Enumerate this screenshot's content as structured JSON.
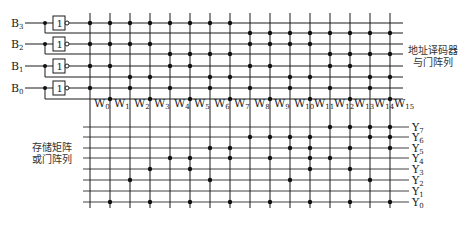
{
  "diagram": {
    "title_decoder": [
      "地址译码器",
      "与门阵列"
    ],
    "title_memory": [
      "存储矩阵",
      "或门阵列"
    ],
    "colors": {
      "line": "#1a1a1a",
      "dot": "#111111",
      "text": "#222222"
    },
    "inputs": [
      {
        "name": "B",
        "sub": "3",
        "y": 23,
        "comp_y": 33
      },
      {
        "name": "B",
        "sub": "2",
        "y": 44,
        "comp_y": 54
      },
      {
        "name": "B",
        "sub": "1",
        "y": 66,
        "comp_y": 77
      },
      {
        "name": "B",
        "sub": "0",
        "y": 88,
        "comp_y": 99
      }
    ],
    "gate_label": "1",
    "word_lines": [
      {
        "name": "W",
        "sub": "0",
        "x": 90,
        "and_rows": [
          0,
          2,
          4,
          6
        ],
        "or_outputs": []
      },
      {
        "name": "W",
        "sub": "1",
        "x": 110,
        "and_rows": [
          0,
          2,
          4,
          7
        ],
        "or_outputs": [
          0
        ]
      },
      {
        "name": "W",
        "sub": "2",
        "x": 130,
        "and_rows": [
          0,
          2,
          5,
          6
        ],
        "or_outputs": [
          2
        ]
      },
      {
        "name": "W",
        "sub": "3",
        "x": 150,
        "and_rows": [
          0,
          2,
          5,
          7
        ],
        "or_outputs": [
          3,
          0
        ]
      },
      {
        "name": "W",
        "sub": "4",
        "x": 170,
        "and_rows": [
          0,
          3,
          4,
          6
        ],
        "or_outputs": [
          4
        ]
      },
      {
        "name": "W",
        "sub": "5",
        "x": 190,
        "and_rows": [
          0,
          3,
          4,
          7
        ],
        "or_outputs": [
          4,
          3,
          0
        ]
      },
      {
        "name": "W",
        "sub": "6",
        "x": 210,
        "and_rows": [
          0,
          3,
          5,
          6
        ],
        "or_outputs": [
          5,
          2
        ]
      },
      {
        "name": "W",
        "sub": "7",
        "x": 230,
        "and_rows": [
          0,
          3,
          5,
          7
        ],
        "or_outputs": [
          5,
          4,
          0
        ]
      },
      {
        "name": "W",
        "sub": "8",
        "x": 250,
        "and_rows": [
          1,
          2,
          4,
          6
        ],
        "or_outputs": [
          6
        ]
      },
      {
        "name": "W",
        "sub": "9",
        "x": 270,
        "and_rows": [
          1,
          2,
          4,
          7
        ],
        "or_outputs": [
          6,
          4,
          0
        ]
      },
      {
        "name": "W",
        "sub": "10",
        "x": 290,
        "and_rows": [
          1,
          2,
          5,
          6
        ],
        "or_outputs": [
          6,
          5,
          2
        ]
      },
      {
        "name": "W",
        "sub": "11",
        "x": 310,
        "and_rows": [
          1,
          2,
          5,
          7
        ],
        "or_outputs": [
          6,
          5,
          4,
          3,
          0
        ]
      },
      {
        "name": "W",
        "sub": "12",
        "x": 330,
        "and_rows": [
          1,
          3,
          4,
          6
        ],
        "or_outputs": [
          7,
          4
        ]
      },
      {
        "name": "W",
        "sub": "13",
        "x": 350,
        "and_rows": [
          1,
          3,
          4,
          7
        ],
        "or_outputs": [
          7,
          5,
          3,
          0
        ]
      },
      {
        "name": "W",
        "sub": "14",
        "x": 370,
        "and_rows": [
          1,
          3,
          5,
          6
        ],
        "or_outputs": [
          7,
          6,
          2
        ]
      },
      {
        "name": "W",
        "sub": "15",
        "x": 390,
        "and_rows": [
          1,
          3,
          5,
          7
        ],
        "or_outputs": [
          7,
          6,
          5,
          0
        ]
      }
    ],
    "outputs": [
      {
        "name": "Y",
        "sub": "7",
        "y": 127
      },
      {
        "name": "Y",
        "sub": "6",
        "y": 137
      },
      {
        "name": "Y",
        "sub": "5",
        "y": 148
      },
      {
        "name": "Y",
        "sub": "4",
        "y": 158
      },
      {
        "name": "Y",
        "sub": "3",
        "y": 169
      },
      {
        "name": "Y",
        "sub": "2",
        "y": 180
      },
      {
        "name": "Y",
        "sub": "1",
        "y": 191
      },
      {
        "name": "Y",
        "sub": "0",
        "y": 202
      }
    ]
  }
}
